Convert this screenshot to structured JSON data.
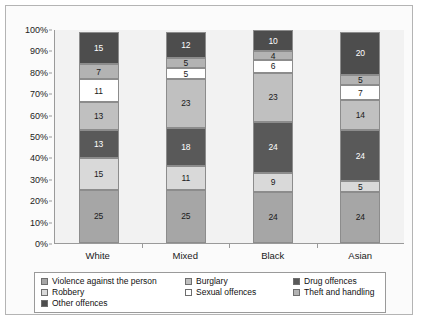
{
  "chart_data": {
    "type": "bar",
    "stacked": true,
    "title": "",
    "subtitle": "",
    "xlabel": "",
    "ylabel": "",
    "grid": false,
    "legend_position": "bottom",
    "categories": [
      "White",
      "Mixed",
      "Black",
      "Asian"
    ],
    "ylim": [
      0,
      100
    ],
    "yticks": [
      "0%",
      "10%",
      "20%",
      "30%",
      "40%",
      "50%",
      "60%",
      "70%",
      "80%",
      "90%",
      "100%"
    ],
    "series": [
      {
        "name": "Violence against the person",
        "color": "#a6a6a6",
        "values": [
          25,
          25,
          24,
          24
        ]
      },
      {
        "name": "Robbery",
        "color": "#d9d9d9",
        "values": [
          15,
          11,
          9,
          5
        ]
      },
      {
        "name": "Drug offences",
        "color": "#595959",
        "values": [
          13,
          18,
          24,
          24
        ]
      },
      {
        "name": "Burglary",
        "color": "#c0c0c0",
        "values": [
          13,
          23,
          23,
          14
        ]
      },
      {
        "name": "Sexual offences",
        "color": "#ffffff",
        "values": [
          11,
          5,
          6,
          7
        ]
      },
      {
        "name": "Theft and handling",
        "color": "#b3b3b3",
        "values": [
          7,
          5,
          4,
          5
        ]
      },
      {
        "name": "Other offences",
        "color": "#4d4d4d",
        "values": [
          15,
          12,
          10,
          20
        ]
      }
    ]
  },
  "legend": {
    "entries": [
      {
        "label": "Violence against the person",
        "color": "#a6a6a6",
        "column": 0,
        "row": 0
      },
      {
        "label": "Robbery",
        "color": "#d9d9d9",
        "column": 0,
        "row": 1
      },
      {
        "label": "Other offences",
        "color": "#4d4d4d",
        "column": 0,
        "row": 2
      },
      {
        "label": "Burglary",
        "color": "#c0c0c0",
        "column": 1,
        "row": 0
      },
      {
        "label": "Sexual offences",
        "color": "#ffffff",
        "column": 1,
        "row": 1
      },
      {
        "label": "Drug offences",
        "color": "#595959",
        "column": 2,
        "row": 0
      },
      {
        "label": "Theft and handling",
        "color": "#b3b3b3",
        "column": 2,
        "row": 1
      }
    ]
  },
  "colors": {
    "plot_background": "#f2f2f2",
    "frame_background": "#fbfbfb",
    "axis_line": "#9a9a9a",
    "segment_border": "#8c8c8c",
    "text": "#1a1a1a"
  }
}
